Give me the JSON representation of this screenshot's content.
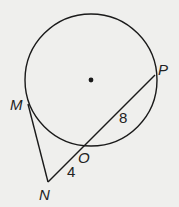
{
  "diagram": {
    "type": "circle-tangent-secant",
    "circle": {
      "cx": 91,
      "cy": 80,
      "r": 66,
      "center_marked": true
    },
    "points": {
      "M": {
        "label": "M",
        "x": 28,
        "y": 104
      },
      "N": {
        "label": "N",
        "x": 48,
        "y": 182
      },
      "O": {
        "label": "O",
        "x": 84,
        "y": 146
      },
      "P": {
        "label": "P",
        "x": 155,
        "y": 75
      }
    },
    "segments": [
      {
        "from": "M",
        "to": "N",
        "role": "tangent"
      },
      {
        "from": "N",
        "to": "P",
        "role": "secant"
      }
    ],
    "lengths": {
      "NO": "4",
      "OP": "8"
    },
    "colors": {
      "stroke": "#1a1a1a",
      "background": "#efefed"
    }
  }
}
